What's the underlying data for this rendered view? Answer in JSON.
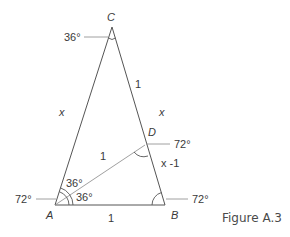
{
  "figure": {
    "caption": "Figure A.3",
    "vertices": {
      "A": {
        "label": "A",
        "x": 55,
        "y": 205
      },
      "B": {
        "label": "B",
        "x": 165,
        "y": 205
      },
      "C": {
        "label": "C",
        "x": 112,
        "y": 27
      },
      "D": {
        "label": "D",
        "x": 145,
        "y": 145
      }
    },
    "sides": {
      "AC": "x",
      "CB_upper": "1",
      "CD_x": "x",
      "DB": "x -1",
      "AD": "1",
      "AB": "1"
    },
    "angles": {
      "C": "36°",
      "A_outer": "72°",
      "A_upper": "36°",
      "A_lower": "36°",
      "D": "72°",
      "B": "72°"
    }
  }
}
